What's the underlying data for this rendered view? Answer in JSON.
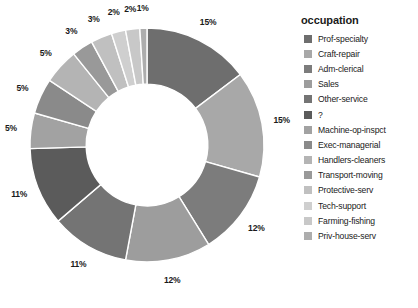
{
  "chart_data": {
    "type": "pie",
    "variant": "donut",
    "title": "",
    "legend_title": "occupation",
    "legend_position": "right",
    "start_angle_deg": 0,
    "direction": "clockwise",
    "inner_radius_ratio": 0.52,
    "categories": [
      "Prof-specialty",
      "Craft-repair",
      "Adm-clerical",
      "Sales",
      "Other-service",
      "?",
      "Machine-op-inspct",
      "Exec-managerial",
      "Handlers-cleaners",
      "Transport-moving",
      "Protective-serv",
      "Tech-support",
      "Farming-fishing",
      "Priv-house-serv"
    ],
    "values": [
      15,
      15,
      12,
      12,
      11,
      11,
      5,
      5,
      5,
      3,
      3,
      2,
      2,
      1
    ],
    "value_labels": [
      "15%",
      "15%",
      "12%",
      "12%",
      "11%",
      "11%",
      "5%",
      "5%",
      "5%",
      "3%",
      "3%",
      "2%",
      "2%",
      "1%"
    ],
    "colors": [
      "#6e6e6e",
      "#a8a8a8",
      "#7c7c7c",
      "#9d9d9d",
      "#747474",
      "#5b5b5b",
      "#a2a2a2",
      "#8a8a8a",
      "#b4b4b4",
      "#999999",
      "#c0c0c0",
      "#cfcfcf",
      "#c8c8c8",
      "#adadad"
    ],
    "slice_separator_color": "#ffffff",
    "background": "#ffffff",
    "xlabel": "",
    "ylabel": "",
    "grid": false
  }
}
